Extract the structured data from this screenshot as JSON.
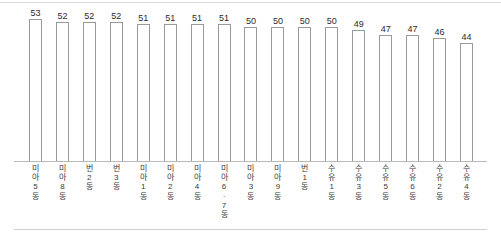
{
  "chart_data": {
    "type": "bar",
    "title": "",
    "subtitle": "",
    "xlabel": "",
    "ylabel": "",
    "grid": false,
    "legend": false,
    "legend_position": "none",
    "ylim": [
      0,
      53
    ],
    "orientation": "vertical",
    "value_labels_shown": true,
    "categories": [
      "미아5동",
      "미아8동",
      "번2동",
      "번3동",
      "미아1동",
      "미아2동",
      "미아4동",
      "미아6·7동",
      "미아3동",
      "미아9동",
      "번1동",
      "수유1동",
      "수유3동",
      "수유5동",
      "수유6동",
      "수유2동",
      "수유4동"
    ],
    "category_chars": [
      [
        "미",
        "아",
        "5",
        "동"
      ],
      [
        "미",
        "아",
        "8",
        "동"
      ],
      [
        "번",
        "2",
        "동"
      ],
      [
        "번",
        "3",
        "동"
      ],
      [
        "미",
        "아",
        "1",
        "동"
      ],
      [
        "미",
        "아",
        "2",
        "동"
      ],
      [
        "미",
        "아",
        "4",
        "동"
      ],
      [
        "미",
        "아",
        "6",
        "·",
        "7",
        "동"
      ],
      [
        "미",
        "아",
        "3",
        "동"
      ],
      [
        "미",
        "아",
        "9",
        "동"
      ],
      [
        "번",
        "1",
        "동"
      ],
      [
        "수",
        "유",
        "1",
        "동"
      ],
      [
        "수",
        "유",
        "3",
        "동"
      ],
      [
        "수",
        "유",
        "5",
        "동"
      ],
      [
        "수",
        "유",
        "6",
        "동"
      ],
      [
        "수",
        "유",
        "2",
        "동"
      ],
      [
        "수",
        "유",
        "4",
        "동"
      ]
    ],
    "values": [
      53,
      52,
      52,
      52,
      51,
      51,
      51,
      51,
      50,
      50,
      50,
      50,
      49,
      47,
      47,
      46,
      44
    ],
    "colors": {
      "bar_fill": "#ffffff",
      "bar_stroke": "#9a9a9a",
      "axis": "#b9b9b9",
      "text": "#2b2b2b",
      "rule": "#dcdcdc",
      "background": "#ffffff"
    }
  }
}
